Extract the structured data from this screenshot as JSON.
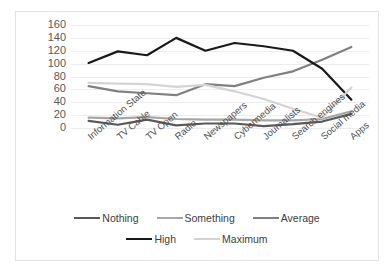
{
  "chart_data": {
    "type": "line",
    "title": "",
    "xlabel": "",
    "ylabel": "",
    "ylim": [
      0,
      160
    ],
    "ytick_step": 20,
    "yticks": [
      "160",
      "140",
      "120",
      "100",
      "80",
      "60",
      "40",
      "20",
      "0"
    ],
    "grid": true,
    "legend_position": "bottom",
    "categories": [
      "Information State",
      "TV Cable",
      "TV Open",
      "Radio",
      "Newspapers",
      "Cybermedia",
      "Journalists",
      "Search engines",
      "Social media",
      "Apps"
    ],
    "series": [
      {
        "name": "Nothing",
        "color": "#595959",
        "values": [
          11,
          5,
          13,
          4,
          7,
          7,
          3,
          6,
          10,
          22
        ]
      },
      {
        "name": "Something",
        "color": "#a6a6a6",
        "values": [
          16,
          15,
          17,
          14,
          13,
          13,
          12,
          12,
          14,
          26
        ]
      },
      {
        "name": "Average",
        "color": "#808080",
        "values": [
          65,
          57,
          54,
          51,
          68,
          65,
          78,
          88,
          106,
          126
        ]
      },
      {
        "name": "High",
        "color": "#1a1a1a",
        "values": [
          101,
          119,
          113,
          140,
          120,
          132,
          127,
          120,
          92,
          44
        ]
      },
      {
        "name": "Maximum",
        "color": "#d4d4d4",
        "values": [
          70,
          69,
          68,
          64,
          67,
          57,
          45,
          30,
          16,
          63
        ]
      }
    ]
  },
  "legend": {
    "rows": [
      [
        {
          "label": "Nothing",
          "color": "#595959"
        },
        {
          "label": "Something",
          "color": "#a6a6a6"
        },
        {
          "label": "Average",
          "color": "#808080"
        }
      ],
      [
        {
          "label": "High",
          "color": "#1a1a1a"
        },
        {
          "label": "Maximum",
          "color": "#d4d4d4"
        }
      ]
    ]
  },
  "caption": {
    "text": ""
  }
}
